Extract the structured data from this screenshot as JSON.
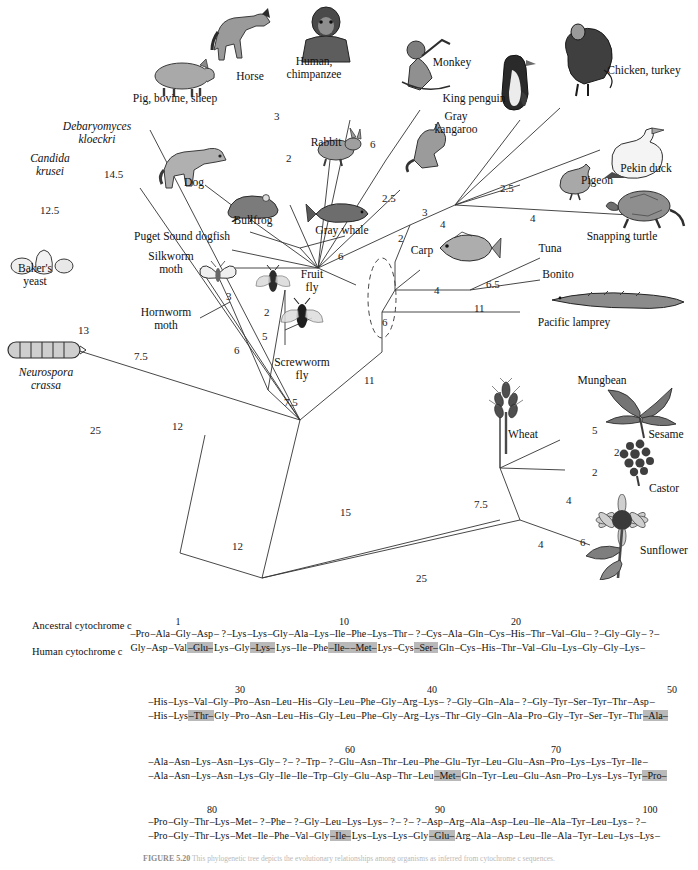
{
  "figure": {
    "caption_label": "FIGURE 5.20",
    "caption_text": "This phylogenetic tree depicts the evolutionary relationships among organisms as inferred from cytochrome c sequences."
  },
  "tree": {
    "taxa": [
      {
        "id": "pig-bovine-sheep",
        "label": "Pig, bovine, sheep",
        "italic": false
      },
      {
        "id": "horse",
        "label": "Horse",
        "italic": false
      },
      {
        "id": "human-chimpanzee",
        "label": "Human,\nchimpanzee",
        "italic": false
      },
      {
        "id": "monkey",
        "label": "Monkey",
        "italic": false
      },
      {
        "id": "king-penguin",
        "label": "King penguin",
        "italic": false
      },
      {
        "id": "chicken-turkey",
        "label": "Chicken, turkey",
        "italic": false
      },
      {
        "id": "rabbit",
        "label": "Rabbit",
        "italic": false
      },
      {
        "id": "gray-kangaroo",
        "label": "Gray\nkangaroo",
        "italic": false
      },
      {
        "id": "pekin-duck",
        "label": "Pekin duck",
        "italic": false
      },
      {
        "id": "dog",
        "label": "Dog",
        "italic": false
      },
      {
        "id": "pigeon",
        "label": "Pigeon",
        "italic": false
      },
      {
        "id": "snapping-turtle",
        "label": "Snapping turtle",
        "italic": false
      },
      {
        "id": "bullfrog",
        "label": "Bullfrog",
        "italic": false
      },
      {
        "id": "gray-whale",
        "label": "Gray whale",
        "italic": false
      },
      {
        "id": "carp",
        "label": "Carp",
        "italic": false
      },
      {
        "id": "tuna",
        "label": "Tuna",
        "italic": false
      },
      {
        "id": "bonito",
        "label": "Bonito",
        "italic": false
      },
      {
        "id": "puget-sound-dogfish",
        "label": "Puget Sound dogfish",
        "italic": false
      },
      {
        "id": "silkworm-moth",
        "label": "Silkworm\nmoth",
        "italic": false
      },
      {
        "id": "fruit-fly",
        "label": "Fruit\nfly",
        "italic": false
      },
      {
        "id": "hornworm-moth",
        "label": "Hornworm\nmoth",
        "italic": false
      },
      {
        "id": "screwworm-fly",
        "label": "Screwworm\nfly",
        "italic": false
      },
      {
        "id": "pacific-lamprey",
        "label": "Pacific lamprey",
        "italic": false
      },
      {
        "id": "debaryomyces-kloeckri",
        "label": "Debaryomyces\nkloeckri",
        "italic": true
      },
      {
        "id": "candida-krusei",
        "label": "Candida\nkrusei",
        "italic": true
      },
      {
        "id": "bakers-yeast",
        "label": "Baker's\nyeast",
        "italic": false
      },
      {
        "id": "neurospora-crassa",
        "label": "Neurospora\ncrassa",
        "italic": true
      },
      {
        "id": "wheat",
        "label": "Wheat",
        "italic": false
      },
      {
        "id": "mungbean",
        "label": "Mungbean",
        "italic": false
      },
      {
        "id": "sesame",
        "label": "Sesame",
        "italic": false
      },
      {
        "id": "castor",
        "label": "Castor",
        "italic": false
      },
      {
        "id": "sunflower",
        "label": "Sunflower",
        "italic": false
      }
    ],
    "branch_lengths": [
      {
        "id": "bl-horse",
        "value": "3"
      },
      {
        "id": "bl-pig",
        "value": "2"
      },
      {
        "id": "bl-human",
        "value": "6"
      },
      {
        "id": "bl-kangaroo",
        "value": "2.5"
      },
      {
        "id": "bl-birds",
        "value": "2.5"
      },
      {
        "id": "bl-pigeon",
        "value": "2.5"
      },
      {
        "id": "bl-duck",
        "value": "4"
      },
      {
        "id": "bl-turtle",
        "value": "4"
      },
      {
        "id": "bl-amniote",
        "value": "3"
      },
      {
        "id": "bl-tetrapod",
        "value": "2"
      },
      {
        "id": "bl-bullfrog",
        "value": "6"
      },
      {
        "id": "bl-carp",
        "value": "4"
      },
      {
        "id": "bl-tunabonito",
        "value": "6.5"
      },
      {
        "id": "bl-lamprey",
        "value": "11"
      },
      {
        "id": "bl-vertebrate",
        "value": "6"
      },
      {
        "id": "bl-silkworm",
        "value": "3"
      },
      {
        "id": "bl-fruitfly",
        "value": "2"
      },
      {
        "id": "bl-screwworm",
        "value": "5"
      },
      {
        "id": "bl-hornworm",
        "value": "6"
      },
      {
        "id": "bl-insect",
        "value": "7.5"
      },
      {
        "id": "bl-animal",
        "value": "11"
      },
      {
        "id": "bl-deep-animal",
        "value": "15"
      },
      {
        "id": "bl-candida",
        "value": "12.5"
      },
      {
        "id": "bl-debaryomyces",
        "value": "14.5"
      },
      {
        "id": "bl-yeast",
        "value": "13"
      },
      {
        "id": "bl-fungi",
        "value": "7.5"
      },
      {
        "id": "bl-fungi2",
        "value": "12"
      },
      {
        "id": "bl-neurospora",
        "value": "25"
      },
      {
        "id": "bl-root",
        "value": "12"
      },
      {
        "id": "bl-plant-root",
        "value": "25"
      },
      {
        "id": "bl-wheat",
        "value": "7.5"
      },
      {
        "id": "bl-mungbean",
        "value": "5"
      },
      {
        "id": "bl-sesame",
        "value": "2"
      },
      {
        "id": "bl-dicot",
        "value": "2"
      },
      {
        "id": "bl-castor",
        "value": "4"
      },
      {
        "id": "bl-plant",
        "value": "4"
      },
      {
        "id": "bl-sunflower",
        "value": "6"
      }
    ]
  },
  "sequences": {
    "row_labels": {
      "ancestral": "Ancestral\ncytochrome c",
      "human": "Human\ncytochrome c"
    },
    "blocks": [
      {
        "id": "block-1",
        "position_numbers": [
          {
            "value": "1",
            "x": 178
          },
          {
            "value": "10",
            "x": 344
          },
          {
            "value": "20",
            "x": 516
          }
        ],
        "ancestral": [
          {
            "r": "–Pro"
          },
          {
            "r": "–Ala"
          },
          {
            "r": "–Gly"
          },
          {
            "r": "–Asp"
          },
          {
            "r": "– ?"
          },
          {
            "r": "–Lys"
          },
          {
            "r": "–Lys"
          },
          {
            "r": "–Gly"
          },
          {
            "r": "–Ala"
          },
          {
            "r": "–Lys"
          },
          {
            "r": "–Ile"
          },
          {
            "r": "–Phe"
          },
          {
            "r": "–Lys"
          },
          {
            "r": "–Thr"
          },
          {
            "r": "– ?"
          },
          {
            "r": "–Cys"
          },
          {
            "r": "–Ala"
          },
          {
            "r": "–Gln"
          },
          {
            "r": "–Cys"
          },
          {
            "r": "–His"
          },
          {
            "r": "–Thr"
          },
          {
            "r": "–Val"
          },
          {
            "r": "–Glu"
          },
          {
            "r": "– ?"
          },
          {
            "r": "–Gly"
          },
          {
            "r": "–Gly"
          },
          {
            "r": "– ?"
          },
          {
            "r": "–"
          }
        ],
        "human": [
          {
            "r": "Gly"
          },
          {
            "r": "–Asp"
          },
          {
            "r": "–Val"
          },
          {
            "r": "–Glu–",
            "hl": true
          },
          {
            "r": "Lys"
          },
          {
            "r": "–Gly"
          },
          {
            "r": "–Lys–",
            "hl": true
          },
          {
            "r": "Lys"
          },
          {
            "r": "–Ile"
          },
          {
            "r": "–Phe"
          },
          {
            "r": "–Ile–",
            "hl": true
          },
          {
            "r": "–Met–",
            "hl": true
          },
          {
            "r": "Lys"
          },
          {
            "r": "–Cys"
          },
          {
            "r": "–Ser–",
            "hl": true
          },
          {
            "r": "Gln"
          },
          {
            "r": "–Cys"
          },
          {
            "r": "–His"
          },
          {
            "r": "–Thr"
          },
          {
            "r": "–Val"
          },
          {
            "r": "–Glu"
          },
          {
            "r": "–Lys"
          },
          {
            "r": "–Gly"
          },
          {
            "r": "–Gly"
          },
          {
            "r": "–Lys"
          },
          {
            "r": "–"
          }
        ]
      },
      {
        "id": "block-2",
        "position_numbers": [
          {
            "value": "30",
            "x": 240
          },
          {
            "value": "40",
            "x": 432
          },
          {
            "value": "50",
            "x": 672
          }
        ],
        "ancestral": [
          {
            "r": "–His"
          },
          {
            "r": "–Lys"
          },
          {
            "r": "–Val"
          },
          {
            "r": "–Gly"
          },
          {
            "r": "–Pro"
          },
          {
            "r": "–Asn"
          },
          {
            "r": "–Leu"
          },
          {
            "r": "–His"
          },
          {
            "r": "–Gly"
          },
          {
            "r": "–Leu"
          },
          {
            "r": "–Phe"
          },
          {
            "r": "–Gly"
          },
          {
            "r": "–Arg"
          },
          {
            "r": "–Lys"
          },
          {
            "r": "– ?"
          },
          {
            "r": "–Gly"
          },
          {
            "r": "–Gln"
          },
          {
            "r": "–Ala"
          },
          {
            "r": "– ?"
          },
          {
            "r": "–Gly"
          },
          {
            "r": "–Tyr"
          },
          {
            "r": "–Ser"
          },
          {
            "r": "–Tyr"
          },
          {
            "r": "–Thr"
          },
          {
            "r": "–Asp"
          },
          {
            "r": "–"
          }
        ],
        "human": [
          {
            "r": "–His"
          },
          {
            "r": "–Lys"
          },
          {
            "r": "–Thr–",
            "hl": true
          },
          {
            "r": "Gly"
          },
          {
            "r": "–Pro"
          },
          {
            "r": "–Asn"
          },
          {
            "r": "–Leu"
          },
          {
            "r": "–His"
          },
          {
            "r": "–Gly"
          },
          {
            "r": "–Leu"
          },
          {
            "r": "–Phe"
          },
          {
            "r": "–Gly"
          },
          {
            "r": "–Arg"
          },
          {
            "r": "–Lys"
          },
          {
            "r": "–Thr"
          },
          {
            "r": "–Gly"
          },
          {
            "r": "–Gln"
          },
          {
            "r": "–Ala"
          },
          {
            "r": "–Pro"
          },
          {
            "r": "–Gly"
          },
          {
            "r": "–Tyr"
          },
          {
            "r": "–Ser"
          },
          {
            "r": "–Tyr"
          },
          {
            "r": "–Thr"
          },
          {
            "r": "–Ala–",
            "hl": true
          }
        ]
      },
      {
        "id": "block-3",
        "position_numbers": [
          {
            "value": "60",
            "x": 350
          },
          {
            "value": "70",
            "x": 556
          }
        ],
        "ancestral": [
          {
            "r": "–Ala"
          },
          {
            "r": "–Asn"
          },
          {
            "r": "–Lys"
          },
          {
            "r": "–Asn"
          },
          {
            "r": "–Lys"
          },
          {
            "r": "–Gly"
          },
          {
            "r": "– ?"
          },
          {
            "r": "– ?"
          },
          {
            "r": "–Trp"
          },
          {
            "r": "– ?"
          },
          {
            "r": "–Glu"
          },
          {
            "r": "–Asn"
          },
          {
            "r": "–Thr"
          },
          {
            "r": "–Leu"
          },
          {
            "r": "–Phe"
          },
          {
            "r": "–Glu"
          },
          {
            "r": "–Tyr"
          },
          {
            "r": "–Leu"
          },
          {
            "r": "–Glu"
          },
          {
            "r": "–Asn"
          },
          {
            "r": "–Pro"
          },
          {
            "r": "–Lys"
          },
          {
            "r": "–Lys"
          },
          {
            "r": "–Tyr"
          },
          {
            "r": "–Ile"
          },
          {
            "r": "–"
          }
        ],
        "human": [
          {
            "r": "–Ala"
          },
          {
            "r": "–Asn"
          },
          {
            "r": "–Lys"
          },
          {
            "r": "–Asn"
          },
          {
            "r": "–Lys"
          },
          {
            "r": "–Gly"
          },
          {
            "r": "–Ile"
          },
          {
            "r": "–Ile"
          },
          {
            "r": "–Trp"
          },
          {
            "r": "–Gly"
          },
          {
            "r": "–Glu"
          },
          {
            "r": "–Asp"
          },
          {
            "r": "–Thr"
          },
          {
            "r": "–Leu"
          },
          {
            "r": "–Met–",
            "hl": true
          },
          {
            "r": "Gln"
          },
          {
            "r": "–Tyr"
          },
          {
            "r": "–Leu"
          },
          {
            "r": "–Glu"
          },
          {
            "r": "–Asn"
          },
          {
            "r": "–Pro"
          },
          {
            "r": "–Lys"
          },
          {
            "r": "–Lys"
          },
          {
            "r": "–Tyr"
          },
          {
            "r": "–Pro–",
            "hl": true
          }
        ]
      },
      {
        "id": "block-4",
        "position_numbers": [
          {
            "value": "80",
            "x": 212
          },
          {
            "value": "90",
            "x": 440
          },
          {
            "value": "100",
            "x": 650
          }
        ],
        "ancestral": [
          {
            "r": "–Pro"
          },
          {
            "r": "–Gly"
          },
          {
            "r": "–Thr"
          },
          {
            "r": "–Lys"
          },
          {
            "r": "–Met"
          },
          {
            "r": "– ?"
          },
          {
            "r": "–Phe"
          },
          {
            "r": "– ?"
          },
          {
            "r": "–Gly"
          },
          {
            "r": "–Leu"
          },
          {
            "r": "–Lys"
          },
          {
            "r": "–Lys"
          },
          {
            "r": "– ?"
          },
          {
            "r": "– ?"
          },
          {
            "r": "– ?"
          },
          {
            "r": "–Asp"
          },
          {
            "r": "–Arg"
          },
          {
            "r": "–Ala"
          },
          {
            "r": "–Asp"
          },
          {
            "r": "–Leu"
          },
          {
            "r": "–Ile"
          },
          {
            "r": "–Ala"
          },
          {
            "r": "–Tyr"
          },
          {
            "r": "–Leu"
          },
          {
            "r": "–Lys"
          },
          {
            "r": "– ?"
          },
          {
            "r": "–"
          }
        ],
        "human": [
          {
            "r": "–Pro"
          },
          {
            "r": "–Gly"
          },
          {
            "r": "–Thr"
          },
          {
            "r": "–Lys"
          },
          {
            "r": "–Met"
          },
          {
            "r": "–Ile"
          },
          {
            "r": "–Phe"
          },
          {
            "r": "–Val"
          },
          {
            "r": "–Gly"
          },
          {
            "r": "–Ile–",
            "hl": true
          },
          {
            "r": "Lys"
          },
          {
            "r": "–Lys"
          },
          {
            "r": "–Lys"
          },
          {
            "r": "–Gly"
          },
          {
            "r": "–Glu–",
            "hl": true
          },
          {
            "r": "Arg"
          },
          {
            "r": "–Ala"
          },
          {
            "r": "–Asp"
          },
          {
            "r": "–Leu"
          },
          {
            "r": "–Ile"
          },
          {
            "r": "–Ala"
          },
          {
            "r": "–Tyr"
          },
          {
            "r": "–Leu"
          },
          {
            "r": "–Lys"
          },
          {
            "r": "–Lys"
          },
          {
            "r": "–"
          }
        ]
      }
    ]
  }
}
